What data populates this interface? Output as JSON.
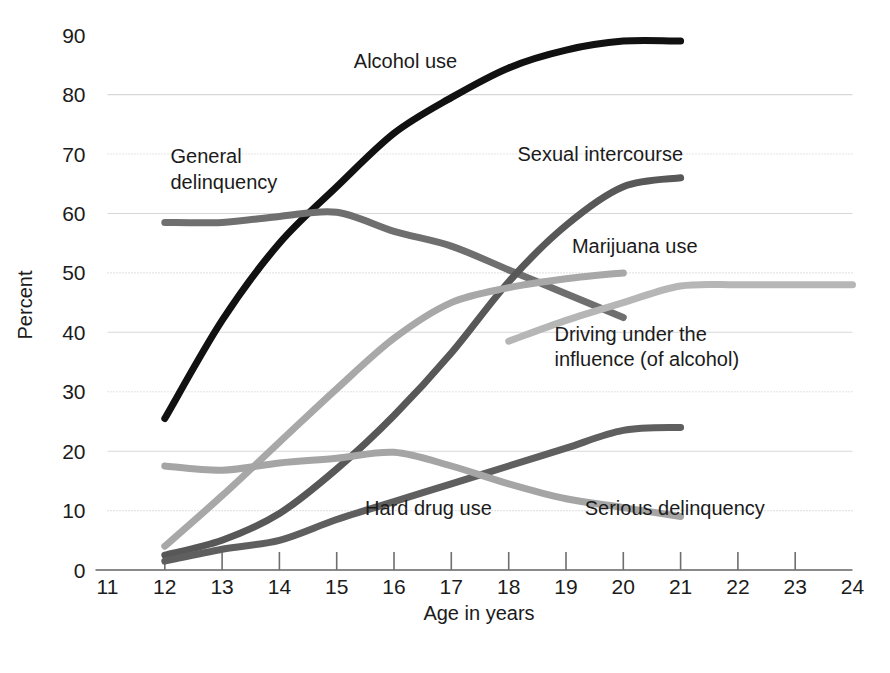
{
  "chart_data": {
    "type": "line",
    "title": "",
    "xlabel": "Age in years",
    "ylabel": "Percent",
    "xlim": [
      11,
      24
    ],
    "ylim": [
      0,
      90
    ],
    "grid": true,
    "legend_position": "inline-annotations",
    "x_ticks": [
      11,
      12,
      13,
      14,
      15,
      16,
      17,
      18,
      19,
      20,
      21,
      22,
      23,
      24
    ],
    "y_ticks": [
      0,
      10,
      20,
      30,
      40,
      50,
      60,
      70,
      80,
      90
    ],
    "series": [
      {
        "name": "Alcohol use",
        "color": "#111111",
        "width": 7,
        "x": [
          12,
          13,
          14,
          15,
          16,
          17,
          18,
          19,
          20,
          21
        ],
        "values": [
          25.5,
          42.0,
          55.0,
          64.5,
          73.5,
          79.5,
          84.5,
          87.5,
          89.0,
          89.0
        ]
      },
      {
        "name": "General delinquency",
        "color": "#6f6f6f",
        "width": 7,
        "x": [
          12,
          13,
          14,
          15,
          16,
          17,
          18,
          19,
          20
        ],
        "values": [
          58.5,
          58.5,
          59.5,
          60.2,
          57.0,
          54.5,
          50.5,
          46.5,
          42.5
        ]
      },
      {
        "name": "Sexual intercourse",
        "color": "#585858",
        "width": 7,
        "x": [
          12,
          13,
          14,
          15,
          16,
          17,
          18,
          19,
          20,
          21
        ],
        "values": [
          2.5,
          5.0,
          9.5,
          17.0,
          26.0,
          36.5,
          48.5,
          58.0,
          64.5,
          66.0
        ]
      },
      {
        "name": "Marijuana use",
        "color": "#a8a8a8",
        "width": 7,
        "x": [
          12,
          13,
          14,
          15,
          16,
          17,
          18,
          19,
          20
        ],
        "values": [
          4.0,
          12.5,
          21.5,
          30.5,
          39.0,
          45.0,
          47.5,
          49.0,
          50.0
        ]
      },
      {
        "name": "Driving under the influence (of alcohol)",
        "color": "#b6b6b6",
        "width": 7,
        "x": [
          18,
          19,
          20,
          21,
          22,
          23,
          24
        ],
        "values": [
          38.5,
          42.0,
          45.0,
          47.8,
          48.0,
          48.0,
          48.0
        ]
      },
      {
        "name": "Hard drug use",
        "color": "#5f5f5f",
        "width": 7,
        "x": [
          12,
          13,
          14,
          15,
          16,
          17,
          18,
          19,
          20,
          21
        ],
        "values": [
          1.5,
          3.5,
          5.0,
          8.5,
          11.5,
          14.5,
          17.5,
          20.5,
          23.5,
          24.0
        ]
      },
      {
        "name": "Serious delinquency",
        "color": "#a5a5a5",
        "width": 7,
        "x": [
          12,
          13,
          14,
          15,
          16,
          17,
          18,
          19,
          20,
          21
        ],
        "values": [
          17.5,
          16.8,
          18.0,
          18.8,
          19.8,
          17.5,
          14.5,
          12.0,
          10.5,
          9.0
        ]
      }
    ],
    "annotations": [
      {
        "text": "Alcohol use",
        "x": 16.2,
        "y": 84.5,
        "anchor": "middle"
      },
      {
        "text": "General",
        "x": 12.1,
        "y": 68.5,
        "anchor": "start"
      },
      {
        "text": "delinquency",
        "x": 12.1,
        "y": 64.2,
        "anchor": "start"
      },
      {
        "text": "Sexual intercourse",
        "x": 19.6,
        "y": 68.8,
        "anchor": "middle"
      },
      {
        "text": "Marijuana use",
        "x": 20.2,
        "y": 53.4,
        "anchor": "middle"
      },
      {
        "text": "Driving under the",
        "x": 18.8,
        "y": 38.6,
        "anchor": "start"
      },
      {
        "text": "influence (of alcohol)",
        "x": 18.8,
        "y": 34.4,
        "anchor": "start"
      },
      {
        "text": "Hard drug use",
        "x": 16.6,
        "y": 9.2,
        "anchor": "middle"
      },
      {
        "text": "Serious delinquency",
        "x": 20.9,
        "y": 9.2,
        "anchor": "middle"
      }
    ]
  },
  "axis": {
    "x_title": "Age in years",
    "y_title": "Percent",
    "x_tick_labels": [
      "11",
      "12",
      "13",
      "14",
      "15",
      "16",
      "17",
      "18",
      "19",
      "20",
      "21",
      "22",
      "23",
      "24"
    ],
    "y_tick_labels": [
      "0",
      "10",
      "20",
      "30",
      "40",
      "50",
      "60",
      "70",
      "80",
      "90"
    ]
  }
}
